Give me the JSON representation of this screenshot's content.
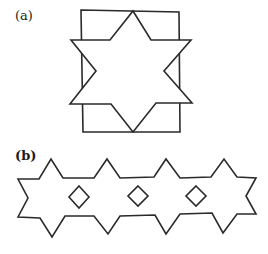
{
  "figure_a": {
    "label": "(a)",
    "description": "Six-pointed star overlapping a rectangle",
    "rectangle": {
      "x1": 81,
      "y1": 10,
      "x2": 179,
      "y2": 132
    },
    "star_points": [
      [
        133,
        11
      ],
      [
        151,
        40
      ],
      [
        191,
        40
      ],
      [
        164,
        71
      ],
      [
        192,
        103
      ],
      [
        156,
        103
      ],
      [
        133,
        132
      ],
      [
        111,
        104
      ],
      [
        70,
        104
      ],
      [
        96,
        71
      ],
      [
        71,
        40
      ],
      [
        110,
        40
      ]
    ]
  },
  "figure_b": {
    "label": "(b)",
    "description": "Frieze of four joined six-pointed stars with three diamond holes",
    "outline_points": [
      [
        18,
        179
      ],
      [
        39,
        179
      ],
      [
        51,
        159
      ],
      [
        63,
        178
      ],
      [
        94,
        178
      ],
      [
        107,
        159
      ],
      [
        120,
        178
      ],
      [
        154,
        177
      ],
      [
        166,
        159
      ],
      [
        180,
        178
      ],
      [
        211,
        177
      ],
      [
        224,
        159
      ],
      [
        237,
        177
      ],
      [
        256,
        178
      ],
      [
        246,
        196
      ],
      [
        256,
        214
      ],
      [
        237,
        214
      ],
      [
        223,
        233
      ],
      [
        212,
        213
      ],
      [
        180,
        214
      ],
      [
        166,
        234
      ],
      [
        155,
        215
      ],
      [
        120,
        216
      ],
      [
        108,
        234
      ],
      [
        94,
        216
      ],
      [
        65,
        216
      ],
      [
        52,
        237
      ],
      [
        40,
        218
      ],
      [
        18,
        217
      ],
      [
        28,
        198
      ]
    ],
    "diamonds": [
      {
        "cx": 79,
        "cy": 197,
        "rx": 10,
        "ry": 11
      },
      {
        "cx": 138,
        "cy": 196,
        "rx": 10,
        "ry": 10
      },
      {
        "cx": 196,
        "cy": 196,
        "rx": 10,
        "ry": 10
      }
    ]
  },
  "colors": {
    "stroke": "#2a2a2a",
    "background": "#ffffff"
  }
}
